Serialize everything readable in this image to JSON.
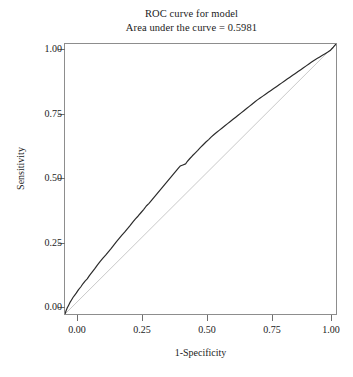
{
  "chart_data": {
    "type": "line",
    "title": "ROC curve for model",
    "subtitle": "Area under the curve = 0.5981",
    "auc": 0.5981,
    "xlabel": "1-Specificity",
    "ylabel": "Sensitivity",
    "xlim": [
      0,
      1
    ],
    "ylim": [
      0,
      1
    ],
    "grid": false,
    "legend": "none",
    "xticks": [
      "0.00",
      "0.25",
      "0.50",
      "0.75",
      "1.00"
    ],
    "xtick_values": [
      0,
      0.25,
      0.5,
      0.75,
      1
    ],
    "yticks": [
      "0.00",
      "0.25",
      "0.50",
      "0.75",
      "1.00"
    ],
    "ytick_values": [
      0,
      0.25,
      0.5,
      0.75,
      1
    ],
    "series": [
      {
        "name": "ROC curve",
        "color": "#2b2b2b",
        "width": 1.2,
        "x": [
          0,
          0.004,
          0.008,
          0.012,
          0.018,
          0.024,
          0.03,
          0.036,
          0.042,
          0.05,
          0.058,
          0.066,
          0.074,
          0.082,
          0.09,
          0.1,
          0.11,
          0.12,
          0.13,
          0.14,
          0.15,
          0.16,
          0.17,
          0.18,
          0.19,
          0.2,
          0.21,
          0.22,
          0.23,
          0.24,
          0.25,
          0.26,
          0.27,
          0.28,
          0.29,
          0.3,
          0.31,
          0.32,
          0.33,
          0.34,
          0.35,
          0.36,
          0.37,
          0.38,
          0.39,
          0.4,
          0.41,
          0.42,
          0.425,
          0.435,
          0.445,
          0.45,
          0.46,
          0.47,
          0.48,
          0.49,
          0.5,
          0.51,
          0.52,
          0.53,
          0.54,
          0.55,
          0.56,
          0.57,
          0.58,
          0.59,
          0.6,
          0.61,
          0.62,
          0.63,
          0.64,
          0.65,
          0.66,
          0.67,
          0.68,
          0.69,
          0.7,
          0.71,
          0.72,
          0.73,
          0.74,
          0.75,
          0.76,
          0.77,
          0.78,
          0.79,
          0.8,
          0.81,
          0.82,
          0.83,
          0.84,
          0.85,
          0.86,
          0.87,
          0.88,
          0.89,
          0.9,
          0.91,
          0.92,
          0.93,
          0.94,
          0.95,
          0.96,
          0.97,
          0.98,
          0.99,
          1
        ],
        "y": [
          0,
          0.012,
          0.022,
          0.03,
          0.042,
          0.052,
          0.062,
          0.07,
          0.078,
          0.09,
          0.1,
          0.112,
          0.122,
          0.13,
          0.142,
          0.155,
          0.168,
          0.182,
          0.195,
          0.207,
          0.218,
          0.23,
          0.242,
          0.255,
          0.268,
          0.28,
          0.292,
          0.303,
          0.315,
          0.327,
          0.34,
          0.352,
          0.363,
          0.375,
          0.387,
          0.4,
          0.41,
          0.422,
          0.434,
          0.446,
          0.458,
          0.47,
          0.482,
          0.494,
          0.506,
          0.518,
          0.53,
          0.542,
          0.548,
          0.552,
          0.556,
          0.563,
          0.575,
          0.586,
          0.596,
          0.606,
          0.617,
          0.627,
          0.637,
          0.646,
          0.656,
          0.665,
          0.673,
          0.681,
          0.689,
          0.697,
          0.705,
          0.713,
          0.721,
          0.729,
          0.737,
          0.745,
          0.753,
          0.761,
          0.769,
          0.777,
          0.785,
          0.793,
          0.8,
          0.807,
          0.814,
          0.821,
          0.828,
          0.835,
          0.842,
          0.849,
          0.856,
          0.863,
          0.87,
          0.877,
          0.884,
          0.891,
          0.898,
          0.905,
          0.912,
          0.919,
          0.926,
          0.933,
          0.94,
          0.946,
          0.952,
          0.958,
          0.964,
          0.97,
          0.977,
          0.988,
          1
        ]
      },
      {
        "name": "Reference diagonal",
        "color": "#c9c9c9",
        "width": 1,
        "x": [
          0,
          1
        ],
        "y": [
          0,
          1
        ]
      }
    ]
  }
}
